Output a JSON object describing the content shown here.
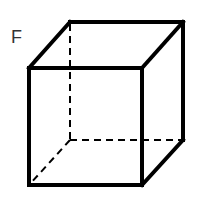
{
  "diagram": {
    "type": "cube-wireframe",
    "label": "F",
    "stroke_color": "#000000",
    "label_color": "#333333",
    "vertices": {
      "front_top_left": [
        29,
        68
      ],
      "front_top_right": [
        142,
        68
      ],
      "front_bottom_left": [
        29,
        185
      ],
      "front_bottom_right": [
        142,
        185
      ],
      "back_top_left": [
        70,
        22
      ],
      "back_top_right": [
        183,
        22
      ],
      "back_bottom_right": [
        183,
        140
      ],
      "back_bottom_left": [
        70,
        140
      ]
    },
    "hidden_edges": [
      "back_top_left-back_bottom_left",
      "back_bottom_left-back_bottom_right",
      "back_bottom_left-front_bottom_left"
    ]
  }
}
